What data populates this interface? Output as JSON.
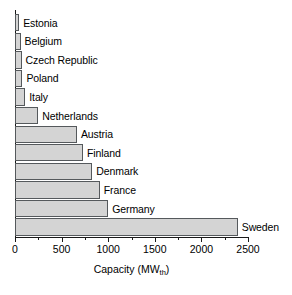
{
  "chart_data": {
    "type": "bar",
    "orientation": "horizontal",
    "title": "",
    "xlabel": "Capacity (MWth)",
    "xlabel_base": "Capacity (MW",
    "xlabel_sub": "th",
    "xlabel_close": ")",
    "ylabel": "",
    "xlim": [
      0,
      2500
    ],
    "xticks": [
      0,
      500,
      1000,
      1500,
      2000,
      2500
    ],
    "xticklabels": [
      "0",
      "500",
      "1000",
      "1500",
      "2000",
      "2500"
    ],
    "minor_ticks": [
      250,
      750,
      1250,
      1750,
      2250
    ],
    "grid": false,
    "legend": null,
    "categories": [
      "Estonia",
      "Belgium",
      "Czech Republic",
      "Poland",
      "Italy",
      "Netherlands",
      "Austria",
      "Finland",
      "Denmark",
      "France",
      "Germany",
      "Sweden"
    ],
    "values": [
      45,
      60,
      70,
      80,
      110,
      250,
      665,
      730,
      830,
      910,
      1000,
      2390
    ],
    "bars": [
      {
        "label": "Estonia",
        "value": 45
      },
      {
        "label": "Belgium",
        "value": 60
      },
      {
        "label": "Czech Republic",
        "value": 70
      },
      {
        "label": "Poland",
        "value": 80
      },
      {
        "label": "Italy",
        "value": 110
      },
      {
        "label": "Netherlands",
        "value": 250
      },
      {
        "label": "Austria",
        "value": 665
      },
      {
        "label": "Finland",
        "value": 730
      },
      {
        "label": "Denmark",
        "value": 830
      },
      {
        "label": "France",
        "value": 910
      },
      {
        "label": "Germany",
        "value": 1000
      },
      {
        "label": "Sweden",
        "value": 2390
      }
    ],
    "colors": {
      "bar_fill": "#d4d4d4",
      "bar_edge": "#55595c",
      "axis": "#1a1a1a",
      "text": "#000000",
      "background": "#ffffff"
    }
  }
}
